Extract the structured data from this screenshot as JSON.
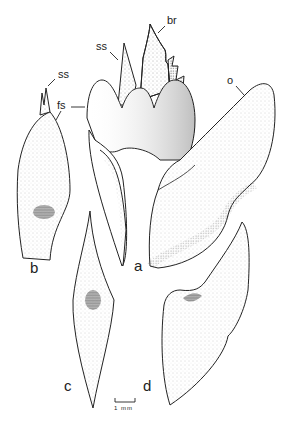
{
  "figure": {
    "panels": [
      {
        "id": "a",
        "label": "a"
      },
      {
        "id": "b",
        "label": "b"
      },
      {
        "id": "c",
        "label": "c"
      },
      {
        "id": "d",
        "label": "d"
      }
    ],
    "annotations": {
      "br": "br",
      "ss_a": "ss",
      "ss_b": "ss",
      "fs": "fs",
      "o": "o"
    },
    "scale_bar": {
      "label": "1 mm"
    },
    "colors": {
      "ink": "#222222",
      "stipple": "#555555",
      "scar": "#6a6a6a",
      "background": "#ffffff"
    }
  }
}
